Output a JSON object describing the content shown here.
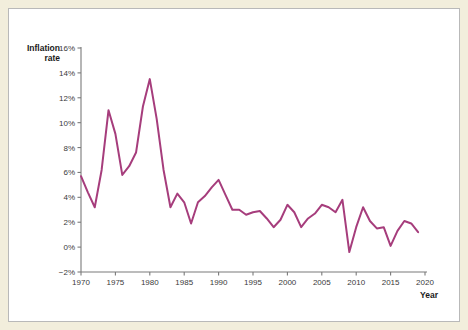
{
  "colors": {
    "background": "#f2eedc",
    "panel": "#ffffff",
    "panel_border": "#b9b9b9",
    "line": "#a63d7c",
    "axis": "#7a7a7a",
    "tick_text": "#3a3a3a",
    "axis_title": "#1b1b1b"
  },
  "axes": {
    "y_title": "Inflation\nrate",
    "x_title": "Year",
    "y_ticks": [
      "-2%",
      "0%",
      "2%",
      "4%",
      "6%",
      "8%",
      "10%",
      "12%",
      "14%",
      "16%"
    ],
    "x_ticks": [
      "1970",
      "1975",
      "1980",
      "1985",
      "1990",
      "1995",
      "2000",
      "2005",
      "2010",
      "2015",
      "2020"
    ]
  },
  "watermark": {
    "text": ""
  },
  "chart_data": {
    "type": "line",
    "title": "",
    "subtitle": "",
    "xlabel": "Year",
    "ylabel": "Inflation rate",
    "xlim": [
      1970,
      2020
    ],
    "ylim": [
      -2,
      16
    ],
    "ytick_step": 2,
    "xtick_step": 5,
    "ytick_suffix": "%",
    "grid": false,
    "legend": false,
    "legend_position": "none",
    "series": [
      {
        "name": "Inflation rate",
        "color": "#a63d7c",
        "x": [
          1970,
          1971,
          1972,
          1973,
          1974,
          1975,
          1976,
          1977,
          1978,
          1979,
          1980,
          1981,
          1982,
          1983,
          1984,
          1985,
          1986,
          1987,
          1988,
          1989,
          1990,
          1991,
          1992,
          1993,
          1994,
          1995,
          1996,
          1997,
          1998,
          1999,
          2000,
          2001,
          2002,
          2003,
          2004,
          2005,
          2006,
          2007,
          2008,
          2009,
          2010,
          2011,
          2012,
          2013,
          2014,
          2015,
          2016,
          2017,
          2018,
          2019
        ],
        "values": [
          5.7,
          4.4,
          3.2,
          6.2,
          11.0,
          9.1,
          5.8,
          6.5,
          7.6,
          11.3,
          13.5,
          10.3,
          6.2,
          3.2,
          4.3,
          3.6,
          1.9,
          3.6,
          4.1,
          4.8,
          5.4,
          4.2,
          3.0,
          3.0,
          2.6,
          2.8,
          2.9,
          2.3,
          1.6,
          2.2,
          3.4,
          2.8,
          1.6,
          2.3,
          2.7,
          3.4,
          3.2,
          2.8,
          3.8,
          -0.4,
          1.6,
          3.2,
          2.1,
          1.5,
          1.6,
          0.1,
          1.3,
          2.1,
          1.9,
          1.2
        ]
      }
    ]
  }
}
